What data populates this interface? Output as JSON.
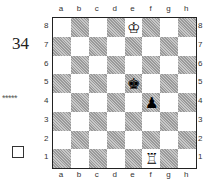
{
  "diagram": {
    "number": "34",
    "stars": "*****",
    "checkbox": "□",
    "files": [
      "a",
      "b",
      "c",
      "d",
      "e",
      "f",
      "g",
      "h"
    ],
    "ranks": [
      "8",
      "7",
      "6",
      "5",
      "4",
      "3",
      "2",
      "1"
    ],
    "pieces": [
      {
        "square": "e8",
        "glyph": "♔",
        "name": "white-king"
      },
      {
        "square": "e5",
        "glyph": "♚",
        "name": "black-king"
      },
      {
        "square": "f4",
        "glyph": "♟",
        "name": "black-pawn"
      },
      {
        "square": "f1",
        "glyph": "♖",
        "name": "white-rook"
      }
    ]
  }
}
